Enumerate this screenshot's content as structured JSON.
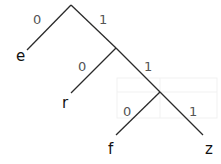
{
  "diagram": {
    "type": "huffman-code-tree",
    "nodes": [
      {
        "id": "n0",
        "x": 71,
        "y": 5
      },
      {
        "id": "n1",
        "x": 116,
        "y": 48
      },
      {
        "id": "n2",
        "x": 160,
        "y": 92
      }
    ],
    "edges": [
      {
        "from": "n0",
        "x1": 71,
        "y1": 5,
        "x2": 27,
        "y2": 50,
        "label": "0",
        "lx": 33,
        "ly": 24,
        "to_leaf": "e"
      },
      {
        "from": "n0",
        "x1": 71,
        "y1": 5,
        "x2": 116,
        "y2": 48,
        "label": "1",
        "lx": 99,
        "ly": 24
      },
      {
        "from": "n1",
        "x1": 116,
        "y1": 48,
        "x2": 71,
        "y2": 93,
        "label": "0",
        "lx": 78,
        "ly": 71,
        "to_leaf": "r"
      },
      {
        "from": "n1",
        "x1": 116,
        "y1": 48,
        "x2": 160,
        "y2": 92,
        "label": "1",
        "lx": 144,
        "ly": 71
      },
      {
        "from": "n2",
        "x1": 160,
        "y1": 92,
        "x2": 116,
        "y2": 135,
        "label": "0",
        "lx": 123,
        "ly": 116,
        "to_leaf": "f"
      },
      {
        "from": "n2",
        "x1": 160,
        "y1": 92,
        "x2": 203,
        "y2": 135,
        "label": "1",
        "lx": 189,
        "ly": 116,
        "to_leaf": "z"
      }
    ],
    "leaves": [
      {
        "symbol": "e",
        "x": 16,
        "y": 61
      },
      {
        "symbol": "r",
        "x": 62,
        "y": 108
      },
      {
        "symbol": "f",
        "x": 108,
        "y": 154
      },
      {
        "symbol": "z",
        "x": 205,
        "y": 154
      }
    ],
    "colors": {
      "edge": "#2a2a2a",
      "label": "#555555",
      "leaf": "#111111"
    }
  }
}
